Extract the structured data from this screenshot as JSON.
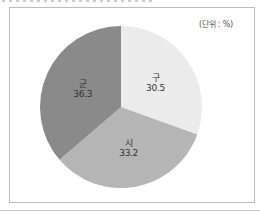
{
  "chart_data": {
    "type": "pie",
    "title": "",
    "unit_label": "(단위 : %)",
    "start_angle_deg": 0,
    "direction": "clockwise",
    "slices": [
      {
        "label": "구",
        "value": 30.5,
        "value_text": "30.5",
        "color": "#ebebeb"
      },
      {
        "label": "시",
        "value": 33.2,
        "value_text": "33.2",
        "color": "#b5b5b5"
      },
      {
        "label": "군",
        "value": 36.3,
        "value_text": "36.3",
        "color": "#8a8a8a"
      }
    ],
    "legend": "none (labels drawn on slices)"
  }
}
